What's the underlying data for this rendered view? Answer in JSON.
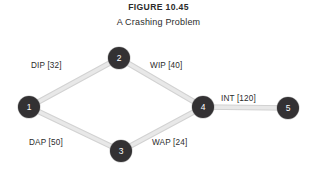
{
  "figure": {
    "title": "FIGURE 10.45",
    "subtitle": "A Crashing Problem"
  },
  "colors": {
    "background": "#ffffff",
    "node_fill": "#333133",
    "node_text": "#ffffff",
    "edge_stroke": "#e8e8e8",
    "edge_stroke_dark": "#d2d2d2",
    "text": "#2b2b2b"
  },
  "diagram": {
    "type": "activity-on-arc-network",
    "nodes": [
      {
        "id": "1",
        "label": "1",
        "cx": 29,
        "cy": 107
      },
      {
        "id": "2",
        "label": "2",
        "cx": 119,
        "cy": 58
      },
      {
        "id": "3",
        "label": "3",
        "cx": 121,
        "cy": 151
      },
      {
        "id": "4",
        "label": "4",
        "cx": 203,
        "cy": 107
      },
      {
        "id": "5",
        "label": "5",
        "cx": 288,
        "cy": 108
      }
    ],
    "edges": [
      {
        "id": "e-1-2",
        "from": "1",
        "to": "2",
        "activity": "DIP",
        "duration": 32,
        "label": "DIP [32]",
        "label_x": 31,
        "label_y": 61
      },
      {
        "id": "e-2-4",
        "from": "2",
        "to": "4",
        "activity": "WIP",
        "duration": 40,
        "label": "WIP [40]",
        "label_x": 150,
        "label_y": 61
      },
      {
        "id": "e-1-3",
        "from": "1",
        "to": "3",
        "activity": "DAP",
        "duration": 50,
        "label": "DAP [50]",
        "label_x": 29,
        "label_y": 138
      },
      {
        "id": "e-3-4",
        "from": "3",
        "to": "4",
        "activity": "WAP",
        "duration": 24,
        "label": "WAP [24]",
        "label_x": 152,
        "label_y": 138
      },
      {
        "id": "e-4-5",
        "from": "4",
        "to": "5",
        "activity": "INT",
        "duration": 120,
        "label": "INT [120]",
        "label_x": 221,
        "label_y": 94
      }
    ]
  }
}
